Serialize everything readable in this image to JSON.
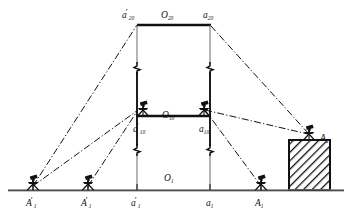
{
  "figure": {
    "kind": "surveying-leveling-diagram",
    "background_color": "#ffffff",
    "line_color": "#111111",
    "hatch_color": "#111111",
    "width": 352,
    "height": 214
  },
  "levels": {
    "ground": {
      "label_main": "O",
      "label_sub": "1",
      "y": 190
    },
    "middle": {
      "label_main": "O",
      "label_sub": "10",
      "y": 116
    },
    "top": {
      "label_main": "O",
      "label_sub": "20",
      "y": 25
    }
  },
  "labels": {
    "top_left_station": {
      "main": "a",
      "sub": "20",
      "prime": "′"
    },
    "top_center_level": {
      "main": "O",
      "sub": "20",
      "prime": ""
    },
    "top_right_station": {
      "main": "a",
      "sub": "20",
      "prime": ""
    },
    "mid_center_level": {
      "main": "O",
      "sub": "10",
      "prime": ""
    },
    "mid_left_station": {
      "main": "a",
      "sub": "10",
      "prime": "′"
    },
    "mid_right_station": {
      "main": "a",
      "sub": "10",
      "prime": ""
    },
    "right_pier_station": {
      "main": "A",
      "sub": "2",
      "prime": ""
    },
    "ground_center_level": {
      "main": "O",
      "sub": "1",
      "prime": ""
    },
    "ground_a1_left": {
      "main": "a",
      "sub": "1",
      "prime": "′"
    },
    "ground_a1_right": {
      "main": "a",
      "sub": "1",
      "prime": ""
    },
    "ground_A1_far_left": {
      "main": "A",
      "sub": "1",
      "prime": "′"
    },
    "ground_A1_left": {
      "main": "A",
      "sub": "1",
      "prime": "′"
    },
    "ground_A1_right": {
      "main": "A",
      "sub": "1",
      "prime": ""
    }
  },
  "instruments": [
    {
      "name": "theodolite-ground-far-left",
      "x": 33,
      "y": 190
    },
    {
      "name": "theodolite-ground-left",
      "x": 88,
      "y": 190
    },
    {
      "name": "theodolite-mid-left",
      "x": 143,
      "y": 116
    },
    {
      "name": "theodolite-mid-right",
      "x": 204,
      "y": 116
    },
    {
      "name": "theodolite-ground-right",
      "x": 261,
      "y": 190
    },
    {
      "name": "theodolite-pier-top",
      "x": 309,
      "y": 140
    }
  ],
  "pier": {
    "name": "hatched-pier",
    "x": 289,
    "y": 140,
    "width": 41,
    "height": 50
  },
  "verticals": [
    {
      "name": "vertical-left",
      "x": 137,
      "y1": 25,
      "y2": 190
    },
    {
      "name": "vertical-right",
      "x": 210,
      "y1": 25,
      "y2": 190
    }
  ],
  "break_marks": [
    {
      "name": "break-mark-left-upper",
      "x": 137,
      "y": 68
    },
    {
      "name": "break-mark-right-upper",
      "x": 210,
      "y": 68
    },
    {
      "name": "break-mark-left-lower",
      "x": 137,
      "y": 150
    },
    {
      "name": "break-mark-right-lower",
      "x": 210,
      "y": 150
    }
  ],
  "sight_lines": [
    {
      "name": "sightline-farleft-to-top-left",
      "x1": 33,
      "y1": 186,
      "x2": 137,
      "y2": 25
    },
    {
      "name": "sightline-farleft-to-mid-left",
      "x1": 33,
      "y1": 186,
      "x2": 137,
      "y2": 112
    },
    {
      "name": "sightline-left-to-mid-left",
      "x1": 88,
      "y1": 186,
      "x2": 137,
      "y2": 112
    },
    {
      "name": "sightline-top-right-to-pier",
      "x1": 210,
      "y1": 25,
      "x2": 307,
      "y2": 134
    },
    {
      "name": "sightline-mid-right-to-pier",
      "x1": 204,
      "y1": 112,
      "x2": 307,
      "y2": 134
    },
    {
      "name": "sightline-mid-right-to-ground",
      "x1": 204,
      "y1": 112,
      "x2": 261,
      "y2": 186
    }
  ]
}
